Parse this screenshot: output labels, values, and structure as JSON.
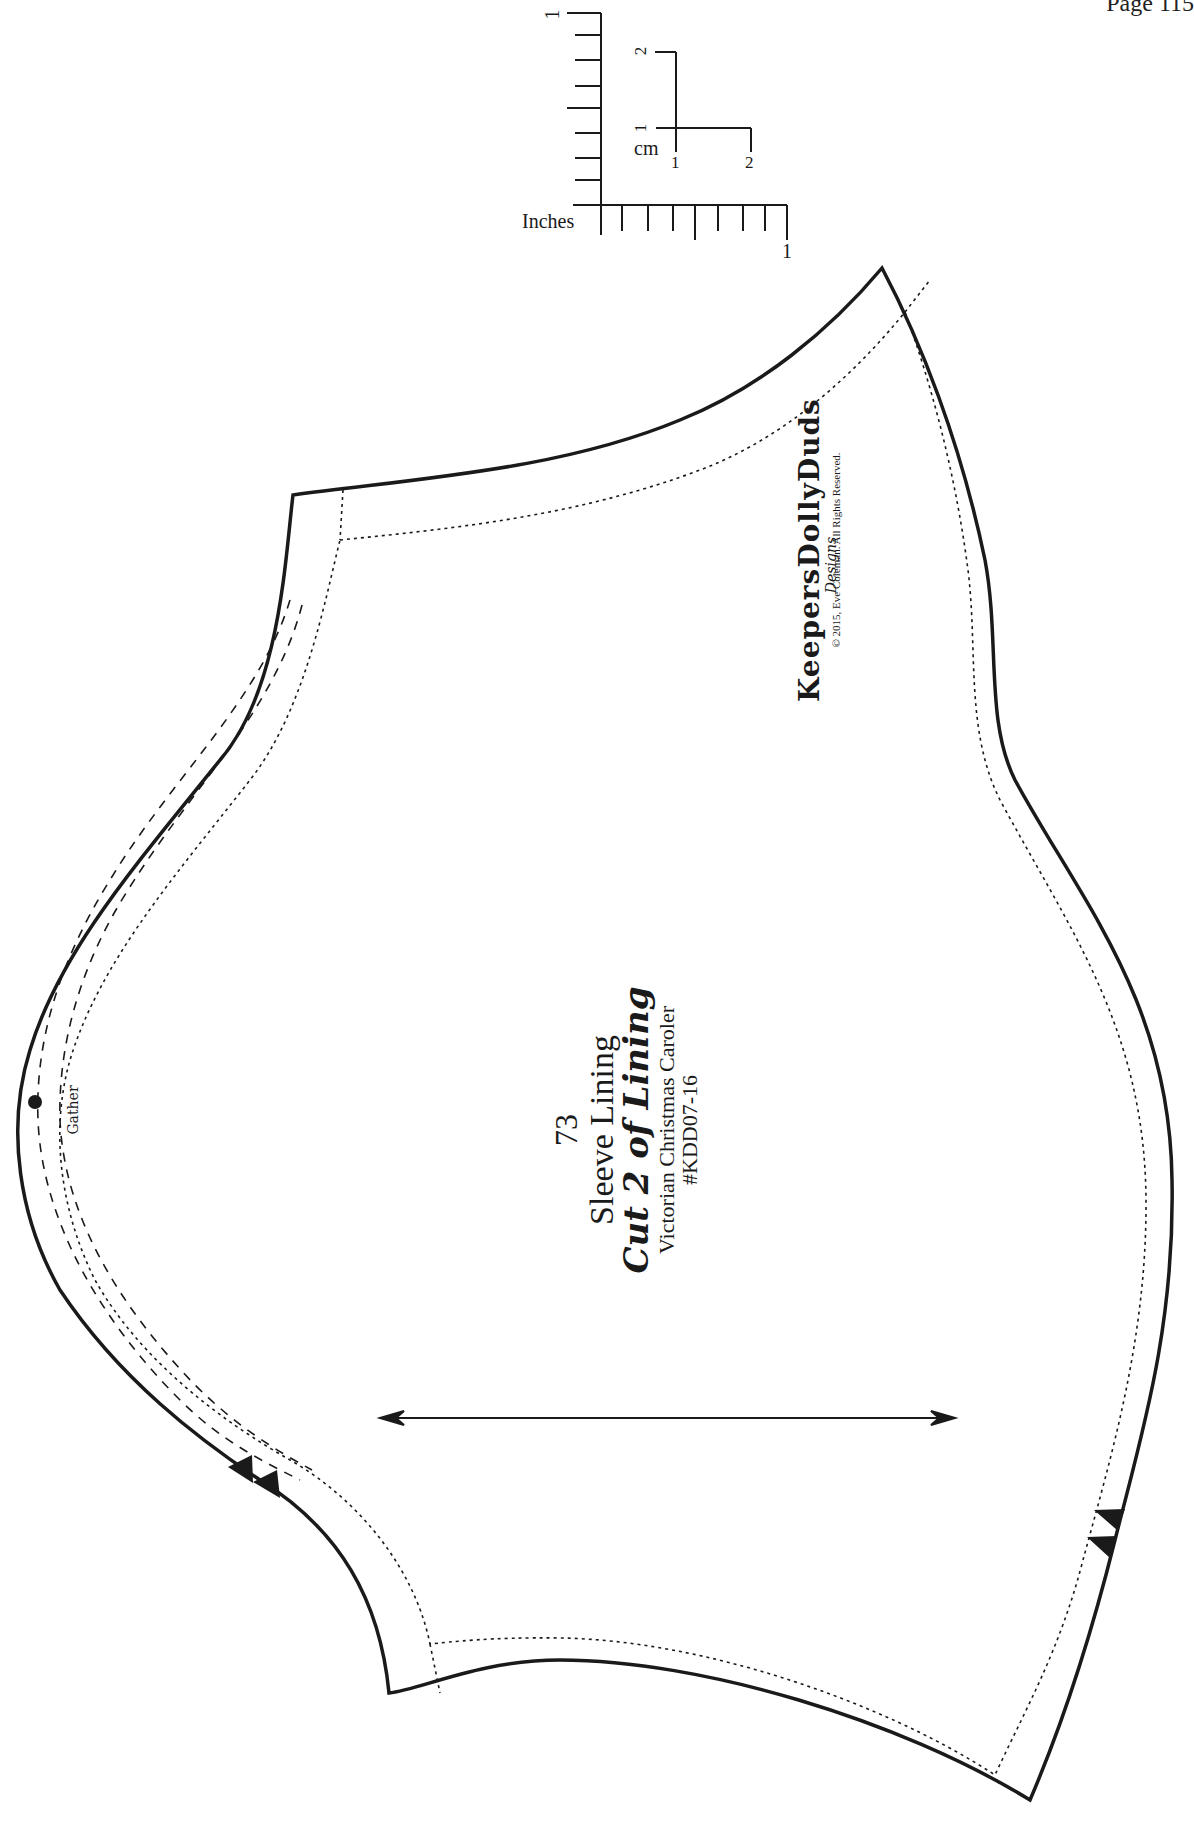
{
  "page": {
    "number_label": "Page 115"
  },
  "ruler": {
    "inches_label": "Inches",
    "inch_vertical_end_label": "1",
    "inch_horizontal_end_label": "1",
    "cm_label": "cm",
    "cm_vertical_labels": [
      "1",
      "2"
    ],
    "cm_horizontal_labels": [
      "1",
      "2"
    ]
  },
  "piece": {
    "number": "73",
    "name": "Sleeve Lining",
    "cut_instruction": "Cut 2 of Lining",
    "collection": "Victorian Christmas Caroler",
    "sku": "#KDD07-16",
    "gather_label": "Gather"
  },
  "brand": {
    "name": "KeepersDollyDuds",
    "sub": "Designs",
    "copyright": "© 2015, Eve Coleman. All Rights Reserved."
  },
  "markings": {
    "grainline": "double-arrow",
    "notches": [
      "double-notch-left",
      "double-notch-right"
    ],
    "gather_dot": "dot"
  },
  "colors": {
    "line": "#1a1a1a",
    "background": "#ffffff"
  }
}
